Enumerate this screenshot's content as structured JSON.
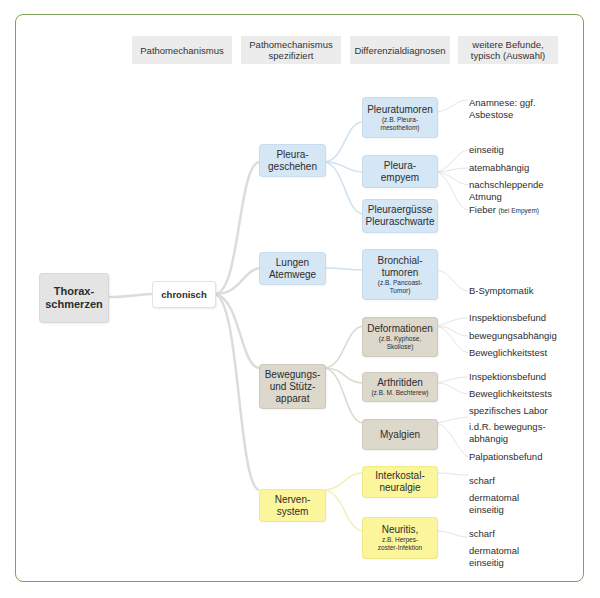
{
  "headers": [
    {
      "label": "Pathomechanismus"
    },
    {
      "label": "Pathomechanismus spezifiziert"
    },
    {
      "label": "Differenzialdiagnosen"
    },
    {
      "label": "weitere Befunde, typisch (Auswahl)"
    }
  ],
  "root": {
    "label": "Thorax-\nschmerzen"
  },
  "mechanism": {
    "label": "chronisch"
  },
  "groups": [
    {
      "label": "Pleura-\ngeschehen",
      "color": "#d5e6f5"
    },
    {
      "label": "Lungen\nAtemwege",
      "color": "#d5e6f5"
    },
    {
      "label": "Bewegungs-\nund Stütz-\napparat",
      "color": "#ddd8cc"
    },
    {
      "label": "Nerven-\nsystem",
      "color": "#fbf59b"
    }
  ],
  "diagnoses": [
    {
      "label": "Pleuratumoren",
      "sub": "(z.B. Pleura-\nmesotheliom)"
    },
    {
      "label": "Pleura-\nempyem",
      "sub": ""
    },
    {
      "label": "Pleuraergüsse\nPleuraschwarte",
      "sub": ""
    },
    {
      "label": "Bronchial-\ntumoren",
      "sub": "(z.B. Pancoast-\nTumor)"
    },
    {
      "label": "Deformationen",
      "sub": "(z.B. Kyphose,\nSkoliose)"
    },
    {
      "label": "Arthritiden",
      "sub": "(z.B. M. Bechterew)"
    },
    {
      "label": "Myalgien",
      "sub": ""
    },
    {
      "label": "Interkostal-\nneuralgie",
      "sub": ""
    },
    {
      "label": "Neuritis,",
      "sub": "z.B. Herpes-\nzoster-Infektion"
    }
  ],
  "findings": [
    {
      "text": "Anamnese: ggf.\nAsbestose"
    },
    {
      "text": "einseitig"
    },
    {
      "text": "atemabhängig"
    },
    {
      "text": "nachschleppende\nAtmung"
    },
    {
      "text": "Fieber",
      "sub": "(bei Empyem)"
    },
    {
      "text": "B-Symptomatik"
    },
    {
      "text": "Inspektionsbefund"
    },
    {
      "text": "bewegungsabhängig"
    },
    {
      "text": "Beweglichkeitstest"
    },
    {
      "text": "Inspektionsbefund"
    },
    {
      "text": "Beweglichkeitstests"
    },
    {
      "text": "spezifisches Labor"
    },
    {
      "text": "i.d.R. bewegungs-\nabhängig"
    },
    {
      "text": "Palpationsbefund"
    },
    {
      "text": "scharf"
    },
    {
      "text": "dermatomal\neinseitig"
    },
    {
      "text": "scharf"
    },
    {
      "text": "dermatomal\neinseitig"
    }
  ],
  "colors": {
    "frame": "#7ba35a",
    "blue": "#d5e6f5",
    "beige": "#ddd8cc",
    "yellow": "#fbf59b",
    "grey": "#e4e4e4"
  }
}
